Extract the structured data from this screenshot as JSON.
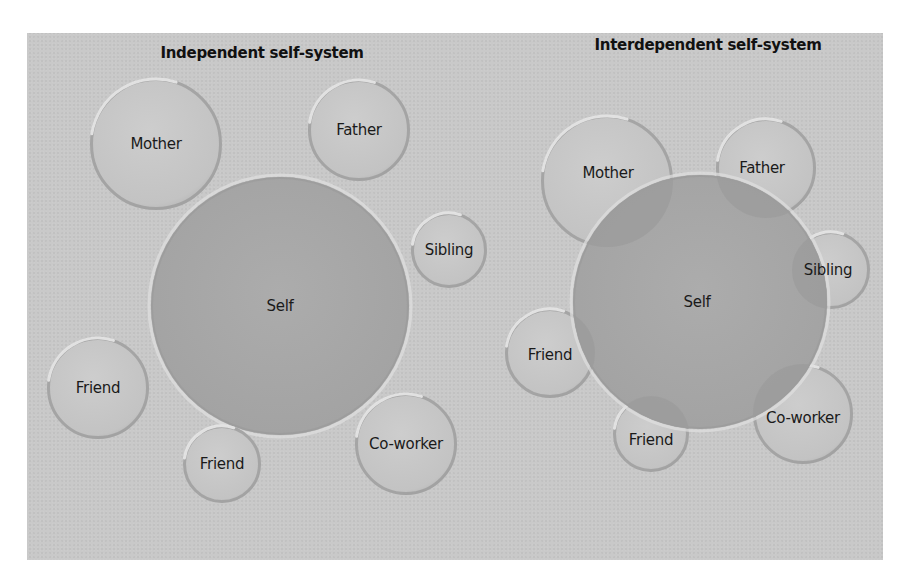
{
  "colors": {
    "page_background": "#ffffff",
    "panel_background": "#c9c9c9",
    "satellite_fill": "#c4c4c4",
    "satellite_rim": "#9a9a9a",
    "satellite_highlight": "#e8e8e8",
    "self_fill": "#a8a8a8",
    "overlap_fill": "#9c9c9c",
    "text": "#1a1a1a"
  },
  "independent": {
    "title": "Independent self-system",
    "self": {
      "label": "Self",
      "cx": 280,
      "cy": 306,
      "r": 129
    },
    "others": [
      {
        "label": "Mother",
        "cx": 156,
        "cy": 144,
        "r": 66
      },
      {
        "label": "Father",
        "cx": 359,
        "cy": 130,
        "r": 51
      },
      {
        "label": "Sibling",
        "cx": 449,
        "cy": 250,
        "r": 38
      },
      {
        "label": "Friend",
        "cx": 98,
        "cy": 388,
        "r": 51
      },
      {
        "label": "Friend",
        "cx": 222,
        "cy": 464,
        "r": 39
      },
      {
        "label": "Co-worker",
        "cx": 406,
        "cy": 444,
        "r": 51
      }
    ]
  },
  "interdependent": {
    "title": "Interdependent self-system",
    "self": {
      "label": "Self",
      "cx": 700,
      "cy": 302,
      "r": 127
    },
    "others": [
      {
        "label": "Mother",
        "cx": 607,
        "cy": 181,
        "r": 66
      },
      {
        "label": "Father",
        "cx": 766,
        "cy": 168,
        "r": 50
      },
      {
        "label": "Sibling",
        "cx": 831,
        "cy": 270,
        "r": 39
      },
      {
        "label": "Friend",
        "cx": 550,
        "cy": 353,
        "r": 45
      },
      {
        "label": "Friend",
        "cx": 651,
        "cy": 434,
        "r": 38
      },
      {
        "label": "Co-worker",
        "cx": 803,
        "cy": 414,
        "r": 50
      }
    ]
  }
}
